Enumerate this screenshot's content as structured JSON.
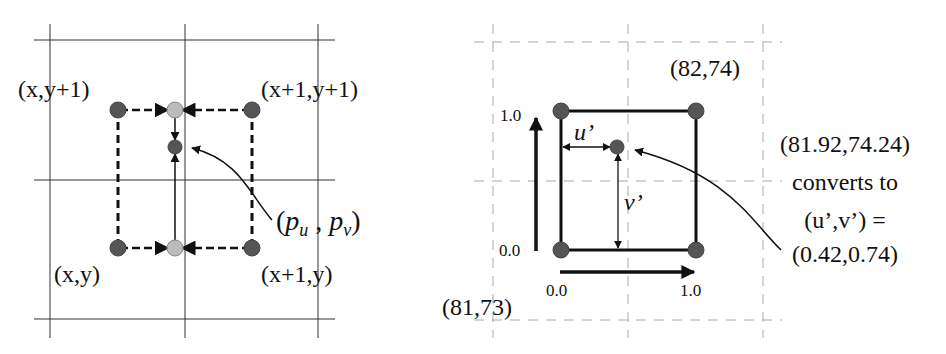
{
  "left_diagram": {
    "corner_labels": {
      "top_left": "(x,y+1)",
      "top_right": "(x+1,y+1)",
      "bottom_left": "(x,y)",
      "bottom_right": "(x+1,y)"
    },
    "point_label": {
      "open": "(",
      "p": "p",
      "sub_u": "u",
      "comma": " , ",
      "p2": "p",
      "sub_v": "v",
      "close": ")"
    },
    "colors": {
      "corner_dot": "#555555",
      "interp_dot": "#bbbbbb",
      "grid": "#333333"
    }
  },
  "right_diagram": {
    "labels": {
      "top_right": "(82,74)",
      "bottom_left": "(81,73)",
      "axis_v_top": "1.0",
      "axis_v_bottom": "0.0",
      "axis_u_left": "0.0",
      "axis_u_right": "1.0",
      "u_prime": "u’",
      "v_prime": "v’"
    },
    "annotation": {
      "line1": "(81.92,74.24)",
      "line2": "converts to",
      "line3": "(u’,v’) =",
      "line4": "(0.42,0.74)"
    },
    "colors": {
      "corner_dot": "#555555",
      "dashed_grid": "#aaaaaa"
    }
  }
}
